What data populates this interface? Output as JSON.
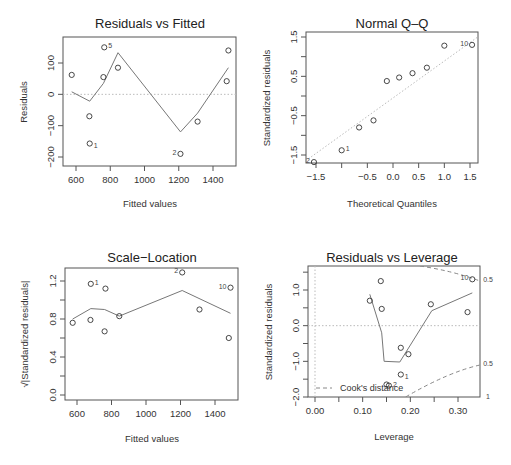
{
  "chart_data": [
    {
      "type": "scatter",
      "title": "Residuals vs Fitted",
      "xlabel": "Fitted values",
      "ylabel": "Residuals",
      "xticks": [
        "600",
        "800",
        "1000",
        "1200",
        "1400"
      ],
      "yticks": [
        "-200",
        "-100",
        "0",
        "100"
      ],
      "xlim": [
        560,
        1500
      ],
      "ylim": [
        -230,
        190
      ],
      "points": [
        {
          "x": 575,
          "y": 62,
          "label": ""
        },
        {
          "x": 678,
          "y": -70,
          "label": ""
        },
        {
          "x": 680,
          "y": -157,
          "label": "1"
        },
        {
          "x": 760,
          "y": 55,
          "label": ""
        },
        {
          "x": 765,
          "y": 150,
          "label": "5"
        },
        {
          "x": 845,
          "y": 85,
          "label": ""
        },
        {
          "x": 1210,
          "y": -190,
          "label": "2"
        },
        {
          "x": 1310,
          "y": -87,
          "label": ""
        },
        {
          "x": 1480,
          "y": 42,
          "label": ""
        },
        {
          "x": 1490,
          "y": 140,
          "label": ""
        }
      ],
      "smooth": [
        [
          575,
          8
        ],
        [
          680,
          -22
        ],
        [
          760,
          35
        ],
        [
          845,
          133
        ],
        [
          1210,
          -120
        ],
        [
          1310,
          -60
        ],
        [
          1490,
          85
        ]
      ],
      "reference_line_y": 0
    },
    {
      "type": "scatter",
      "title": "Normal Q-Q",
      "xlabel": "Theoretical Quantiles",
      "ylabel": "Standardized residuals",
      "xticks": [
        "-1.5",
        "-0.5",
        "0.0",
        "0.5",
        "1.0",
        "1.5"
      ],
      "yticks": [
        "-1.5",
        "-0.5",
        "0.5",
        "1.5"
      ],
      "xlim": [
        -1.65,
        1.65
      ],
      "ylim": [
        -1.7,
        1.6
      ],
      "points": [
        {
          "x": -1.54,
          "y": -1.68,
          "label": "2"
        },
        {
          "x": -1.0,
          "y": -1.38,
          "label": "1"
        },
        {
          "x": -0.66,
          "y": -0.8,
          "label": ""
        },
        {
          "x": -0.38,
          "y": -0.62,
          "label": ""
        },
        {
          "x": -0.12,
          "y": 0.38,
          "label": ""
        },
        {
          "x": 0.12,
          "y": 0.47,
          "label": ""
        },
        {
          "x": 0.38,
          "y": 0.58,
          "label": ""
        },
        {
          "x": 0.66,
          "y": 0.72,
          "label": ""
        },
        {
          "x": 1.0,
          "y": 1.28,
          "label": ""
        },
        {
          "x": 1.54,
          "y": 1.3,
          "label": "10"
        }
      ],
      "reference_line": [
        [
          -1.65,
          -1.6
        ],
        [
          1.65,
          1.5
        ]
      ]
    },
    {
      "type": "scatter",
      "title": "Scale-Location",
      "xlabel": "Fitted values",
      "ylabel": "√|Standardized residuals|",
      "xticks": [
        "600",
        "800",
        "1000",
        "1200",
        "1400"
      ],
      "yticks": [
        "0.0",
        "0.4",
        "0.8",
        "1.2"
      ],
      "xlim": [
        560,
        1500
      ],
      "ylim": [
        -0.05,
        1.35
      ],
      "points": [
        {
          "x": 575,
          "y": 0.76,
          "label": ""
        },
        {
          "x": 678,
          "y": 0.79,
          "label": ""
        },
        {
          "x": 680,
          "y": 1.17,
          "label": "1"
        },
        {
          "x": 760,
          "y": 0.67,
          "label": ""
        },
        {
          "x": 765,
          "y": 1.12,
          "label": ""
        },
        {
          "x": 845,
          "y": 0.83,
          "label": ""
        },
        {
          "x": 1210,
          "y": 1.29,
          "label": "2"
        },
        {
          "x": 1310,
          "y": 0.9,
          "label": ""
        },
        {
          "x": 1480,
          "y": 0.6,
          "label": ""
        },
        {
          "x": 1490,
          "y": 1.13,
          "label": "10"
        }
      ],
      "smooth": [
        [
          575,
          0.8
        ],
        [
          680,
          0.91
        ],
        [
          760,
          0.9
        ],
        [
          845,
          0.83
        ],
        [
          1210,
          1.1
        ],
        [
          1490,
          0.86
        ]
      ]
    },
    {
      "type": "scatter",
      "title": "Residuals vs Leverage",
      "xlabel": "Leverage",
      "ylabel": "Standardized residuals",
      "xticks": [
        "0.00",
        "0.10",
        "0.20",
        "0.30"
      ],
      "yticks": [
        "-2.0",
        "-1.0",
        "0.0",
        "1.0"
      ],
      "xlim": [
        -0.013,
        0.345
      ],
      "ylim": [
        -2.05,
        1.55
      ],
      "points": [
        {
          "x": 0.115,
          "y": 0.7,
          "label": ""
        },
        {
          "x": 0.138,
          "y": 1.25,
          "label": ""
        },
        {
          "x": 0.14,
          "y": 0.47,
          "label": ""
        },
        {
          "x": 0.15,
          "y": -1.65,
          "label": ""
        },
        {
          "x": 0.155,
          "y": -1.68,
          "label": "2"
        },
        {
          "x": 0.18,
          "y": -0.62,
          "label": ""
        },
        {
          "x": 0.18,
          "y": -1.37,
          "label": "1"
        },
        {
          "x": 0.196,
          "y": -0.8,
          "label": ""
        },
        {
          "x": 0.243,
          "y": 0.6,
          "label": ""
        },
        {
          "x": 0.32,
          "y": 0.38,
          "label": ""
        },
        {
          "x": 0.33,
          "y": 1.3,
          "label": "10"
        }
      ],
      "smooth": [
        [
          0.115,
          0.88
        ],
        [
          0.14,
          -0.2
        ],
        [
          0.145,
          -1.0
        ],
        [
          0.178,
          -1.02
        ],
        [
          0.245,
          0.42
        ],
        [
          0.33,
          0.92
        ]
      ],
      "legend": "Cook's distance",
      "cook_labels": [
        "0.5",
        "0.5",
        "1"
      ],
      "reference_line_y": 0
    }
  ],
  "panels": {
    "p1": {
      "title": "Residuals vs Fitted",
      "xlabel": "Fitted values",
      "ylabel": "Residuals"
    },
    "p2": {
      "title": "Normal Q–Q",
      "xlabel": "Theoretical Quantiles",
      "ylabel": "Standardized residuals"
    },
    "p3": {
      "title": "Scale−Location",
      "xlabel": "Fitted values",
      "ylabel": "√|Standardized residuals|"
    },
    "p4": {
      "title": "Residuals vs Leverage",
      "xlabel": "Leverage",
      "ylabel": "Standardized residuals",
      "legend": "Cook's distance"
    }
  }
}
